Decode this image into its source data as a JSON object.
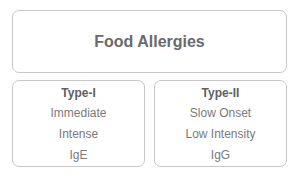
{
  "root": {
    "label": "Food Allergies"
  },
  "types": [
    {
      "title": "Type-I",
      "items": [
        "Immediate",
        "Intense",
        "IgE"
      ]
    },
    {
      "title": "Type-II",
      "items": [
        "Slow Onset",
        "Low Intensity",
        "IgG"
      ]
    }
  ],
  "colors": {
    "border": "#c8c8c8",
    "text": "#6b6b6b",
    "background": "#ffffff"
  }
}
